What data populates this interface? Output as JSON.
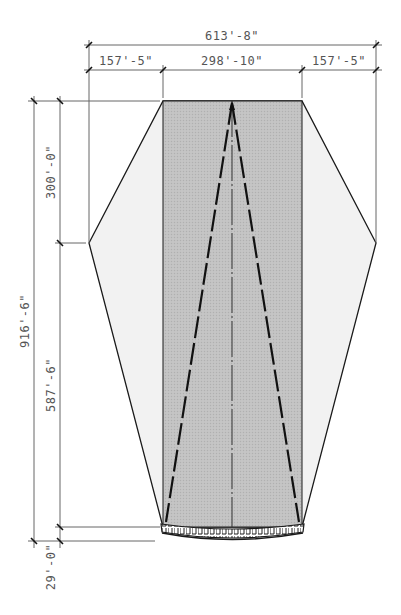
{
  "diagram": {
    "type": "architectural-plan",
    "dimensions": {
      "overall_width": "613'-8\"",
      "left_wing_width": "157'-5\"",
      "center_width": "298'-10\"",
      "right_wing_width": "157'-5\"",
      "upper_length": "300'-0\"",
      "lower_length": "587'-6\"",
      "overall_length": "916'-6\"",
      "end_strip_depth": "29'-0\""
    },
    "colors": {
      "center_fill": "#bdbdbd",
      "wing_fill": "#f1f1f1",
      "outline": "#1a1a1a",
      "dim_line": "#666666",
      "dim_text": "#555555"
    }
  }
}
